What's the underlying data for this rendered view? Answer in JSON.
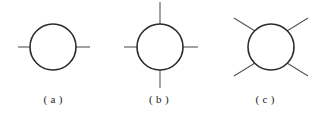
{
  "figure": {
    "background_color": "#ffffff",
    "stroke_color": "#2b2b2b",
    "line_color": "#555555",
    "caption_color": "#1a1a1a",
    "diagrams": [
      {
        "id": "a",
        "caption": "( a )",
        "description": "circle with two horizontal external lines",
        "circle": {
          "cx": 53,
          "cy": 47,
          "r": 23,
          "stroke_width": 1.6
        },
        "legs": [
          {
            "name": "leg-left",
            "x1": 18,
            "y1": 47,
            "x2": 30,
            "y2": 47
          },
          {
            "name": "leg-right",
            "x1": 76,
            "y1": 47,
            "x2": 90,
            "y2": 47
          }
        ]
      },
      {
        "id": "b",
        "caption": "( b )",
        "description": "circle with four orthogonal external lines",
        "circle": {
          "cx": 54,
          "cy": 47,
          "r": 23,
          "stroke_width": 1.6
        },
        "legs": [
          {
            "name": "leg-left",
            "x1": 18,
            "y1": 47,
            "x2": 31,
            "y2": 47
          },
          {
            "name": "leg-right",
            "x1": 77,
            "y1": 47,
            "x2": 92,
            "y2": 47
          },
          {
            "name": "leg-top",
            "x1": 54,
            "y1": 2,
            "x2": 54,
            "y2": 24
          },
          {
            "name": "leg-bottom",
            "x1": 54,
            "y1": 70,
            "x2": 54,
            "y2": 88
          }
        ]
      },
      {
        "id": "c",
        "caption": "( c )",
        "description": "circle with four diagonal external lines",
        "circle": {
          "cx": 59,
          "cy": 47,
          "r": 23,
          "stroke_width": 1.6
        },
        "legs": [
          {
            "name": "leg-upper-left",
            "x1": 22,
            "y1": 18,
            "x2": 43,
            "y2": 31
          },
          {
            "name": "leg-upper-right",
            "x1": 96,
            "y1": 18,
            "x2": 75,
            "y2": 31
          },
          {
            "name": "leg-lower-left",
            "x1": 22,
            "y1": 76,
            "x2": 43,
            "y2": 63
          },
          {
            "name": "leg-lower-right",
            "x1": 96,
            "y1": 76,
            "x2": 75,
            "y2": 63
          }
        ]
      }
    ]
  }
}
